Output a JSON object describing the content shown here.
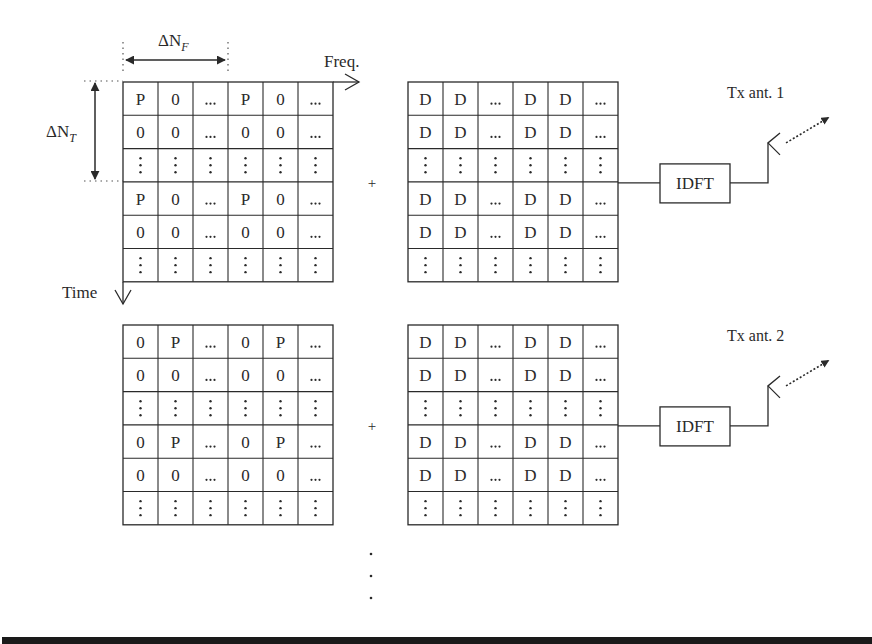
{
  "figure": {
    "freq_axis_label": "Freq.",
    "time_axis_label": "Time",
    "delta_nf_label": "ΔN",
    "delta_nf_subscript": "F",
    "delta_nt_label": "ΔN",
    "delta_nt_subscript": "T",
    "plus_symbol": "+",
    "continuation_dots": "⋮"
  },
  "branches": [
    {
      "pilot_grid": [
        [
          "P",
          "0",
          "...",
          "P",
          "0",
          "..."
        ],
        [
          "0",
          "0",
          "...",
          "0",
          "0",
          "..."
        ],
        [
          ":",
          ":",
          ":",
          ":",
          ":",
          ":"
        ],
        [
          "P",
          "0",
          "...",
          "P",
          "0",
          "..."
        ],
        [
          "0",
          "0",
          "...",
          "0",
          "0",
          "..."
        ],
        [
          ":",
          ":",
          ":",
          ":",
          ":",
          ":"
        ]
      ],
      "data_grid": [
        [
          "D",
          "D",
          "...",
          "D",
          "D",
          "..."
        ],
        [
          "D",
          "D",
          "...",
          "D",
          "D",
          "..."
        ],
        [
          ":",
          ":",
          ":",
          ":",
          ":",
          ":"
        ],
        [
          "D",
          "D",
          "...",
          "D",
          "D",
          "..."
        ],
        [
          "D",
          "D",
          "...",
          "D",
          "D",
          "..."
        ],
        [
          ":",
          ":",
          ":",
          ":",
          ":",
          ":"
        ]
      ],
      "idft_label": "IDFT",
      "antenna_label": "Tx ant. 1"
    },
    {
      "pilot_grid": [
        [
          "0",
          "P",
          "...",
          "0",
          "P",
          "..."
        ],
        [
          "0",
          "0",
          "...",
          "0",
          "0",
          "..."
        ],
        [
          ":",
          ":",
          ":",
          ":",
          ":",
          ":"
        ],
        [
          "0",
          "P",
          "...",
          "0",
          "P",
          "..."
        ],
        [
          "0",
          "0",
          "...",
          "0",
          "0",
          "..."
        ],
        [
          ":",
          ":",
          ":",
          ":",
          ":",
          ":"
        ]
      ],
      "data_grid": [
        [
          "D",
          "D",
          "...",
          "D",
          "D",
          "..."
        ],
        [
          "D",
          "D",
          "...",
          "D",
          "D",
          "..."
        ],
        [
          ":",
          ":",
          ":",
          ":",
          ":",
          ":"
        ],
        [
          "D",
          "D",
          "...",
          "D",
          "D",
          "..."
        ],
        [
          "D",
          "D",
          "...",
          "D",
          "D",
          "..."
        ],
        [
          ":",
          ":",
          ":",
          ":",
          ":",
          ":"
        ]
      ],
      "idft_label": "IDFT",
      "antenna_label": "Tx ant. 2"
    }
  ],
  "colors": {
    "ink": "#2a2a2a",
    "bottom_bar": "#1a1a1a",
    "background": "#ffffff"
  }
}
